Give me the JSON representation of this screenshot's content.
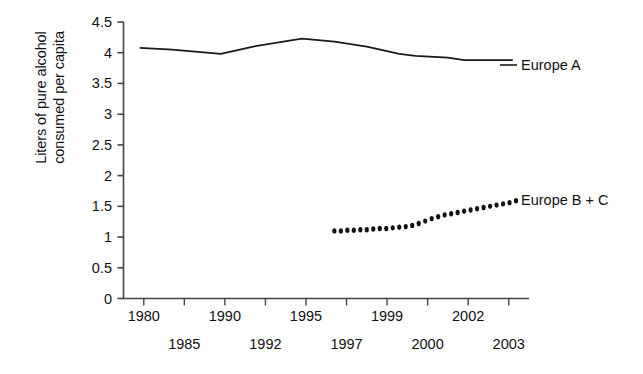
{
  "chart_data": {
    "type": "line",
    "title": "",
    "xlabel": "",
    "ylabel_lines": [
      "Liters of pure alcohol",
      "consumed per capita"
    ],
    "ylabel": "Liters of pure alcohol consumed per capita",
    "ylim": [
      0,
      4.5
    ],
    "xlim": [
      1979,
      2004
    ],
    "grid": false,
    "legend_position": "right-inline",
    "ytick_labels": [
      "0",
      "0.5",
      "1",
      "1.5",
      "2",
      "2.5",
      "3",
      "3.5",
      "4",
      "4.5"
    ],
    "ytick_values": [
      0,
      0.5,
      1,
      1.5,
      2,
      2.5,
      3,
      3.5,
      4,
      4.5
    ],
    "xtick_labels": [
      "1980",
      "1985",
      "1990",
      "1992",
      "1995",
      "1997",
      "1999",
      "2000",
      "2002",
      "2003"
    ],
    "xtick_values": [
      1980,
      1985,
      1990,
      1992,
      1995,
      1997,
      1999,
      2000,
      2002,
      2003
    ],
    "xtick_rows": [
      0,
      1,
      0,
      1,
      0,
      1,
      0,
      1,
      0,
      1
    ],
    "series": [
      {
        "name": "Europe A",
        "style": "solid",
        "color": "#1a1a1a",
        "x": [
          1980,
          1982,
          1985,
          1987,
          1990,
          1992,
          1994,
          1996,
          1997,
          1999,
          2000,
          2002,
          2003
        ],
        "values": [
          4.08,
          4.05,
          3.98,
          4.1,
          4.23,
          4.18,
          4.1,
          3.98,
          3.95,
          3.92,
          3.88,
          3.88,
          3.88
        ]
      },
      {
        "name": "Europe B + C",
        "style": "dotted",
        "color": "#111111",
        "x": [
          1992,
          1992.4,
          1992.8,
          1993.2,
          1993.6,
          1994,
          1994.4,
          1994.8,
          1995.2,
          1995.6,
          1996,
          1996.4,
          1996.8,
          1997.2,
          1997.6,
          1998,
          1998.4,
          1998.8,
          1999.2,
          1999.6,
          2000,
          2000.4,
          2000.8,
          2001.2,
          2001.6,
          2002,
          2002.4,
          2002.8,
          2003.2
        ],
        "values": [
          1.1,
          1.1,
          1.11,
          1.11,
          1.12,
          1.12,
          1.13,
          1.14,
          1.14,
          1.15,
          1.16,
          1.17,
          1.19,
          1.22,
          1.26,
          1.3,
          1.33,
          1.36,
          1.38,
          1.4,
          1.42,
          1.44,
          1.46,
          1.48,
          1.5,
          1.52,
          1.54,
          1.56,
          1.59
        ]
      }
    ],
    "series_labels": [
      {
        "text": "Europe A",
        "marker": "solid-line"
      },
      {
        "text": "Europe B + C",
        "marker": "dotted-line"
      }
    ]
  }
}
